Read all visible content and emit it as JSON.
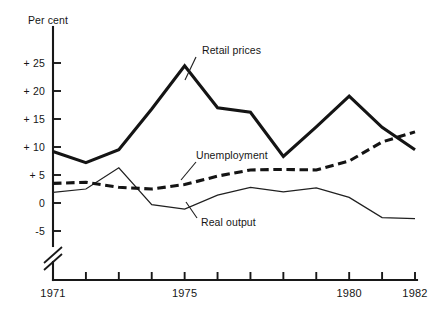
{
  "chart_data": {
    "type": "line",
    "title": "",
    "unit_label": "Per cent",
    "xlabel": "",
    "ylabel": "Per cent",
    "grid": false,
    "legend_position": "inline-annotations",
    "axis_break": true,
    "ylim": [
      -5,
      25
    ],
    "ytick_labels": [
      "+ 25",
      "+ 20",
      "+ 15",
      "+ 10",
      "+ 5",
      "0",
      "-5"
    ],
    "ytick_values": [
      25,
      20,
      15,
      10,
      5,
      0,
      -5
    ],
    "x": [
      1971,
      1972,
      1973,
      1974,
      1975,
      1976,
      1977,
      1978,
      1979,
      1980,
      1981,
      1982
    ],
    "xtick_labels": [
      "1971",
      "",
      "",
      "",
      "1975",
      "",
      "",
      "",
      "",
      "1980",
      "",
      "1982"
    ],
    "xtick_labels_visible": [
      "1971",
      "1975",
      "1980",
      "1982"
    ],
    "series": [
      {
        "name": "Retail prices",
        "style": "thick-solid",
        "values": [
          9.2,
          7.2,
          9.5,
          16.8,
          24.5,
          17.0,
          16.2,
          8.3,
          13.6,
          19.1,
          13.5,
          9.5
        ]
      },
      {
        "name": "Unemployment",
        "style": "dashed",
        "values": [
          3.5,
          3.7,
          2.8,
          2.5,
          3.3,
          4.8,
          5.9,
          6.0,
          5.9,
          7.5,
          10.9,
          12.7
        ]
      },
      {
        "name": "Real output",
        "style": "thin-solid",
        "values": [
          1.9,
          2.5,
          6.3,
          -0.3,
          -1.1,
          1.4,
          2.8,
          2.0,
          2.7,
          1.0,
          -2.6,
          -2.8
        ]
      }
    ],
    "annotations": [
      {
        "label": "Retail prices",
        "x": 198,
        "y": 51
      },
      {
        "label": "Unemployment",
        "x": 190,
        "y": 157
      },
      {
        "label": "Real output",
        "x": 196,
        "y": 223
      }
    ],
    "colors": {
      "ink": "#141414",
      "background": "#ffffff"
    }
  }
}
